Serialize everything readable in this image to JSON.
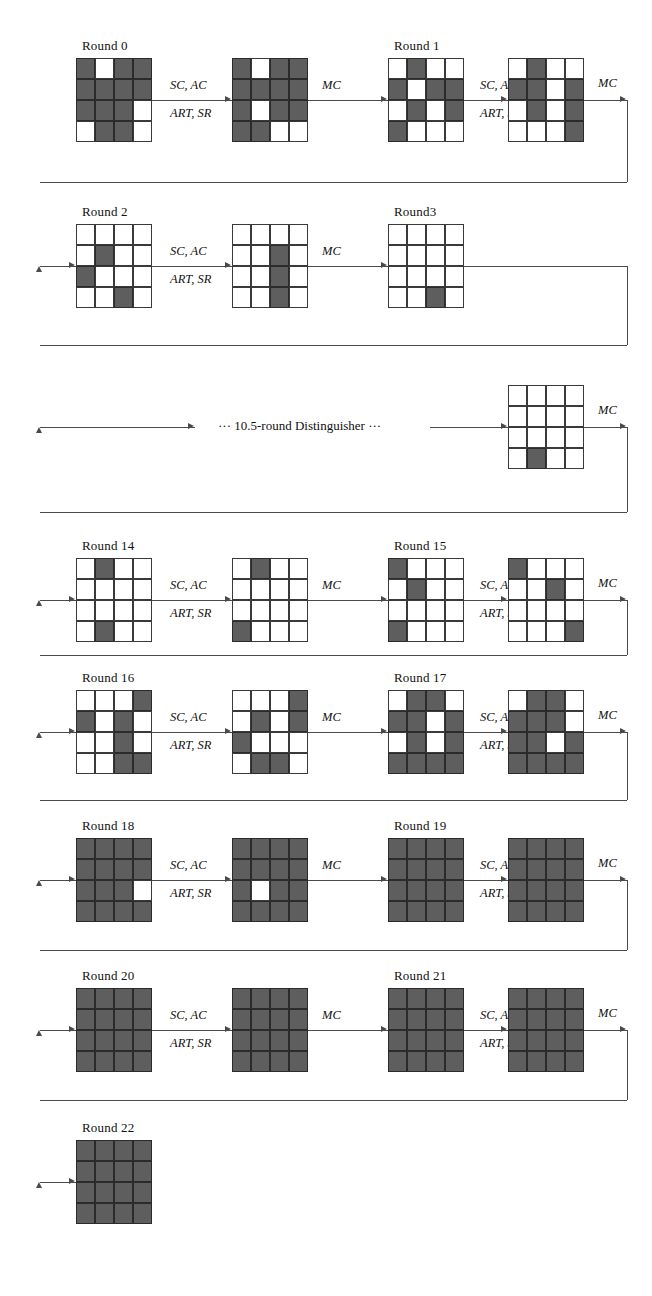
{
  "figure": {
    "kind": "cipher-differential-trail",
    "grid_rows": 4,
    "grid_cols": 4,
    "colors": {
      "active_cell": "#5e5e5e",
      "inactive_cell": "#ffffff",
      "line": "#4a4a4a",
      "text": "#111111"
    },
    "ops": {
      "first": "SC, AC",
      "second": "ART, SR",
      "mix": "MC"
    },
    "distinguisher_label": "··· 10.5-round Distinguisher ···"
  },
  "rounds": [
    {
      "label": "Round 0",
      "pre": [
        [
          1,
          0,
          1,
          1
        ],
        [
          1,
          1,
          1,
          1
        ],
        [
          1,
          1,
          1,
          0
        ],
        [
          0,
          1,
          1,
          0
        ]
      ],
      "post": [
        [
          1,
          0,
          1,
          1
        ],
        [
          1,
          1,
          1,
          1
        ],
        [
          1,
          0,
          1,
          1
        ],
        [
          1,
          1,
          0,
          0
        ]
      ]
    },
    {
      "label": "Round 1",
      "pre": [
        [
          0,
          1,
          0,
          0
        ],
        [
          1,
          0,
          1,
          1
        ],
        [
          0,
          1,
          0,
          1
        ],
        [
          1,
          0,
          0,
          0
        ]
      ],
      "post": [
        [
          0,
          1,
          0,
          0
        ],
        [
          1,
          1,
          0,
          1
        ],
        [
          0,
          1,
          0,
          1
        ],
        [
          0,
          0,
          0,
          1
        ]
      ]
    },
    {
      "label": "Round 2",
      "pre": [
        [
          0,
          0,
          0,
          0
        ],
        [
          0,
          1,
          0,
          0
        ],
        [
          1,
          0,
          0,
          0
        ],
        [
          0,
          0,
          1,
          0
        ]
      ],
      "post": [
        [
          0,
          0,
          0,
          0
        ],
        [
          0,
          0,
          1,
          0
        ],
        [
          0,
          0,
          1,
          0
        ],
        [
          0,
          0,
          1,
          0
        ]
      ]
    },
    {
      "label": "Round3",
      "pre": [
        [
          0,
          0,
          0,
          0
        ],
        [
          0,
          0,
          0,
          0
        ],
        [
          0,
          0,
          0,
          0
        ],
        [
          0,
          0,
          1,
          0
        ]
      ],
      "post": null
    },
    {
      "label": "",
      "pre": [
        [
          0,
          0,
          0,
          0
        ],
        [
          0,
          0,
          0,
          0
        ],
        [
          0,
          0,
          0,
          0
        ],
        [
          0,
          1,
          0,
          0
        ]
      ],
      "post": null
    },
    {
      "label": "Round 14",
      "pre": [
        [
          0,
          1,
          0,
          0
        ],
        [
          0,
          0,
          0,
          0
        ],
        [
          0,
          0,
          0,
          0
        ],
        [
          0,
          1,
          0,
          0
        ]
      ],
      "post": [
        [
          0,
          1,
          0,
          0
        ],
        [
          0,
          0,
          0,
          0
        ],
        [
          0,
          0,
          0,
          0
        ],
        [
          1,
          0,
          0,
          0
        ]
      ]
    },
    {
      "label": "Round 15",
      "pre": [
        [
          1,
          0,
          0,
          0
        ],
        [
          0,
          1,
          0,
          0
        ],
        [
          0,
          0,
          0,
          0
        ],
        [
          1,
          0,
          0,
          0
        ]
      ],
      "post": [
        [
          1,
          0,
          0,
          0
        ],
        [
          0,
          0,
          1,
          0
        ],
        [
          0,
          0,
          0,
          0
        ],
        [
          0,
          0,
          0,
          1
        ]
      ]
    },
    {
      "label": "Round 16",
      "pre": [
        [
          0,
          0,
          0,
          1
        ],
        [
          1,
          0,
          1,
          0
        ],
        [
          0,
          0,
          1,
          0
        ],
        [
          0,
          0,
          1,
          1
        ]
      ],
      "post": [
        [
          0,
          0,
          0,
          1
        ],
        [
          0,
          1,
          0,
          1
        ],
        [
          1,
          0,
          0,
          0
        ],
        [
          0,
          1,
          1,
          0
        ]
      ]
    },
    {
      "label": "Round 17",
      "pre": [
        [
          0,
          1,
          1,
          0
        ],
        [
          1,
          1,
          0,
          1
        ],
        [
          0,
          1,
          0,
          1
        ],
        [
          1,
          1,
          1,
          1
        ]
      ],
      "post": [
        [
          0,
          1,
          1,
          0
        ],
        [
          1,
          1,
          1,
          0
        ],
        [
          1,
          1,
          0,
          1
        ],
        [
          1,
          1,
          1,
          1
        ]
      ]
    },
    {
      "label": "Round 18",
      "pre": [
        [
          1,
          1,
          1,
          1
        ],
        [
          1,
          1,
          1,
          1
        ],
        [
          1,
          1,
          1,
          0
        ],
        [
          1,
          1,
          1,
          1
        ]
      ],
      "post": [
        [
          1,
          1,
          1,
          1
        ],
        [
          1,
          1,
          1,
          1
        ],
        [
          1,
          0,
          1,
          1
        ],
        [
          1,
          1,
          1,
          1
        ]
      ]
    },
    {
      "label": "Round 19",
      "pre": [
        [
          1,
          1,
          1,
          1
        ],
        [
          1,
          1,
          1,
          1
        ],
        [
          1,
          1,
          1,
          1
        ],
        [
          1,
          1,
          1,
          1
        ]
      ],
      "post": [
        [
          1,
          1,
          1,
          1
        ],
        [
          1,
          1,
          1,
          1
        ],
        [
          1,
          1,
          1,
          1
        ],
        [
          1,
          1,
          1,
          1
        ]
      ]
    },
    {
      "label": "Round 20",
      "pre": [
        [
          1,
          1,
          1,
          1
        ],
        [
          1,
          1,
          1,
          1
        ],
        [
          1,
          1,
          1,
          1
        ],
        [
          1,
          1,
          1,
          1
        ]
      ],
      "post": [
        [
          1,
          1,
          1,
          1
        ],
        [
          1,
          1,
          1,
          1
        ],
        [
          1,
          1,
          1,
          1
        ],
        [
          1,
          1,
          1,
          1
        ]
      ]
    },
    {
      "label": "Round 21",
      "pre": [
        [
          1,
          1,
          1,
          1
        ],
        [
          1,
          1,
          1,
          1
        ],
        [
          1,
          1,
          1,
          1
        ],
        [
          1,
          1,
          1,
          1
        ]
      ],
      "post": [
        [
          1,
          1,
          1,
          1
        ],
        [
          1,
          1,
          1,
          1
        ],
        [
          1,
          1,
          1,
          1
        ],
        [
          1,
          1,
          1,
          1
        ]
      ]
    },
    {
      "label": "Round 22",
      "pre": [
        [
          1,
          1,
          1,
          1
        ],
        [
          1,
          1,
          1,
          1
        ],
        [
          1,
          1,
          1,
          1
        ],
        [
          1,
          1,
          1,
          1
        ]
      ],
      "post": null
    }
  ],
  "rows": [
    {
      "name": "row-0",
      "round_labels": [
        "Round 0",
        "Round 1"
      ],
      "ops_visible": [
        "SC, AC",
        "ART, SR",
        "MC",
        "SC, AC",
        "ART, SR",
        "MC"
      ]
    },
    {
      "name": "row-1",
      "round_labels": [
        "Round 2",
        "Round3"
      ],
      "ops_visible": [
        "SC, AC",
        "ART, SR",
        "MC"
      ]
    },
    {
      "name": "row-distinguisher",
      "round_labels": [],
      "ops_visible": [
        "MC"
      ]
    },
    {
      "name": "row-2",
      "round_labels": [
        "Round 14",
        "Round 15"
      ],
      "ops_visible": [
        "SC, AC",
        "ART, SR",
        "MC",
        "SC, AC",
        "ART, SR",
        "MC"
      ]
    },
    {
      "name": "row-3",
      "round_labels": [
        "Round 16",
        "Round 17"
      ],
      "ops_visible": [
        "SC, AC",
        "ART, SR",
        "MC",
        "SC, AC",
        "ART, SR",
        "MC"
      ]
    },
    {
      "name": "row-4",
      "round_labels": [
        "Round 18",
        "Round 19"
      ],
      "ops_visible": [
        "SC, AC",
        "ART, SR",
        "MC",
        "SC, AC",
        "ART, SR",
        "MC"
      ]
    },
    {
      "name": "row-5",
      "round_labels": [
        "Round 20",
        "Round 21"
      ],
      "ops_visible": [
        "SC, AC",
        "ART, SR",
        "MC",
        "SC, AC",
        "ART, SR",
        "MC"
      ]
    },
    {
      "name": "row-6",
      "round_labels": [
        "Round 22"
      ],
      "ops_visible": []
    }
  ]
}
